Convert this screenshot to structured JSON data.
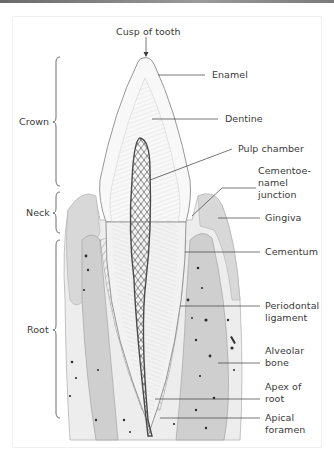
{
  "figure": {
    "labels": {
      "cusp": "Cusp of tooth",
      "enamel": "Enamel",
      "dentine": "Dentine",
      "pulp_chamber": "Pulp chamber",
      "cej": "Cementoe-\nnamel\njunction",
      "gingiva": "Gingiva",
      "cementum": "Cementum",
      "periodontal_ligament": "Periodontal\nligament",
      "alveolar_bone": "Alveolar\nbone",
      "apex_of_root": "Apex of\nroot",
      "apical_foramen": "Apical\nforamen"
    },
    "regions": {
      "crown": "Crown",
      "neck": "Neck",
      "root": "Root"
    },
    "colors": {
      "line": "#3c3c3c",
      "enamel": "#f7f7f7",
      "dentine": "#ebebeb",
      "pulp": "#7a7a7a",
      "gingiva": "#d6d6d6",
      "bone": "#c9c9c9",
      "spot": "#2e2e2e"
    }
  }
}
